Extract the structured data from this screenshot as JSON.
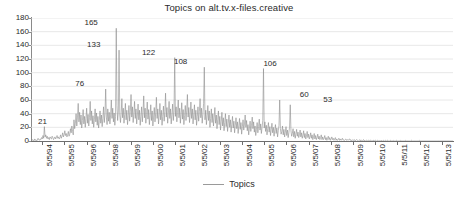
{
  "chart_data": {
    "type": "line",
    "title": "Topics on alt.tv.x-files.creative",
    "xlabel": "",
    "ylabel": "",
    "ylim": [
      0,
      180
    ],
    "ytick_step": 20,
    "yticks": [
      "0",
      "20",
      "40",
      "60",
      "80",
      "100",
      "120",
      "140",
      "160",
      "180"
    ],
    "xticks": [
      "5/5/94",
      "5/5/95",
      "5/5/96",
      "5/5/98",
      "5/5/99",
      "5/5/00",
      "5/5/01",
      "5/5/02",
      "5/5/03",
      "5/5/04",
      "5/5/05",
      "5/5/06",
      "5/5/07",
      "5/5/08",
      "5/5/09",
      "5/5/10",
      "5/5/11",
      "5/5/12",
      "5/5/13"
    ],
    "grid": true,
    "grid_axis": "y",
    "legend": [
      {
        "name": "Topics",
        "color": "#9a9a9a",
        "position": "bottom-center"
      }
    ],
    "series_color": "#8d8d8d",
    "annotations": [
      {
        "label": "21",
        "value": 21,
        "x_frac": 0.012
      },
      {
        "label": "76",
        "value": 76,
        "x_frac": 0.1
      },
      {
        "label": "133",
        "value": 133,
        "x_frac": 0.128
      },
      {
        "label": "165",
        "value": 165,
        "x_frac": 0.122
      },
      {
        "label": "122",
        "value": 122,
        "x_frac": 0.258
      },
      {
        "label": "108",
        "value": 108,
        "x_frac": 0.334
      },
      {
        "label": "106",
        "value": 106,
        "x_frac": 0.546
      },
      {
        "label": "60",
        "value": 60,
        "x_frac": 0.632
      },
      {
        "label": "53",
        "value": 53,
        "x_frac": 0.688
      }
    ],
    "series": [
      {
        "name": "Topics",
        "description": "Weekly topic counts on the Usenet newsgroup alt.tv.x-files.creative, 5/5/1994 through 5/5/2013. Dense high-frequency noise peaking 1996-2000, decaying to near zero after 2009.",
        "values": [
          1,
          0,
          2,
          1,
          0,
          3,
          1,
          2,
          0,
          1,
          4,
          2,
          1,
          3,
          2,
          5,
          3,
          8,
          4,
          21,
          6,
          9,
          4,
          7,
          3,
          5,
          2,
          6,
          4,
          3,
          7,
          5,
          2,
          4,
          6,
          3,
          5,
          8,
          4,
          6,
          3,
          5,
          9,
          4,
          7,
          12,
          6,
          9,
          15,
          8,
          11,
          6,
          9,
          14,
          7,
          10,
          18,
          12,
          22,
          14,
          9,
          31,
          18,
          26,
          40,
          22,
          35,
          55,
          28,
          42,
          24,
          38,
          19,
          30,
          46,
          25,
          36,
          20,
          33,
          48,
          26,
          39,
          22,
          34,
          58,
          30,
          44,
          25,
          37,
          20,
          32,
          47,
          28,
          41,
          23,
          36,
          19,
          30,
          44,
          26,
          38,
          21,
          33,
          50,
          27,
          40,
          76,
          35,
          24,
          47,
          29,
          42,
          25,
          38,
          60,
          33,
          48,
          28,
          41,
          23,
          36,
          165,
          52,
          30,
          44,
          133,
          38,
          27,
          41,
          62,
          34,
          48,
          26,
          39,
          55,
          31,
          45,
          24,
          37,
          52,
          29,
          43,
          68,
          35,
          50,
          27,
          40,
          58,
          33,
          47,
          25,
          38,
          54,
          31,
          45,
          23,
          36,
          50,
          28,
          42,
          66,
          34,
          48,
          26,
          39,
          57,
          32,
          46,
          24,
          37,
          53,
          30,
          44,
          22,
          35,
          49,
          28,
          41,
          64,
          33,
          47,
          25,
          38,
          55,
          31,
          45,
          23,
          36,
          51,
          29,
          43,
          70,
          35,
          49,
          26,
          40,
          58,
          33,
          47,
          25,
          38,
          54,
          30,
          44,
          122,
          36,
          50,
          28,
          42,
          60,
          34,
          48,
          26,
          39,
          56,
          32,
          46,
          24,
          37,
          52,
          30,
          44,
          68,
          35,
          49,
          27,
          40,
          57,
          33,
          47,
          25,
          38,
          53,
          31,
          45,
          23,
          36,
          50,
          29,
          43,
          62,
          34,
          48,
          26,
          39,
          55,
          108,
          31,
          45,
          24,
          37,
          52,
          30,
          44,
          20,
          33,
          47,
          27,
          40,
          22,
          35,
          49,
          26,
          38,
          18,
          31,
          44,
          24,
          36,
          16,
          29,
          42,
          22,
          34,
          15,
          27,
          40,
          21,
          32,
          14,
          26,
          38,
          20,
          31,
          13,
          24,
          36,
          19,
          29,
          12,
          23,
          34,
          18,
          28,
          11,
          22,
          33,
          17,
          27,
          10,
          21,
          31,
          16,
          25,
          38,
          20,
          30,
          15,
          24,
          9,
          19,
          29,
          14,
          23,
          35,
          18,
          28,
          13,
          22,
          8,
          17,
          27,
          12,
          21,
          32,
          16,
          25,
          11,
          20,
          30,
          106,
          19,
          28,
          14,
          23,
          9,
          18,
          27,
          13,
          21,
          8,
          17,
          26,
          12,
          20,
          7,
          16,
          24,
          11,
          19,
          6,
          15,
          23,
          60,
          18,
          10,
          14,
          22,
          9,
          17,
          6,
          13,
          21,
          8,
          16,
          5,
          12,
          20,
          53,
          15,
          7,
          11,
          18,
          6,
          14,
          4,
          10,
          17,
          7,
          13,
          5,
          9,
          16,
          6,
          12,
          4,
          8,
          15,
          5,
          11,
          3,
          7,
          14,
          5,
          10,
          3,
          6,
          12,
          4,
          9,
          2,
          6,
          11,
          3,
          8,
          2,
          5,
          10,
          3,
          7,
          2,
          5,
          9,
          2,
          6,
          2,
          4,
          8,
          2,
          5,
          1,
          4,
          7,
          2,
          5,
          1,
          3,
          6,
          2,
          4,
          1,
          3,
          5,
          1,
          3,
          1,
          2,
          4,
          1,
          3,
          1,
          2,
          4,
          1,
          2,
          1,
          2,
          3,
          1,
          2,
          1,
          2,
          3,
          1,
          2,
          0,
          1,
          2,
          1,
          2,
          0,
          1,
          2,
          1,
          1,
          0,
          1,
          2,
          0,
          1,
          0,
          1,
          2,
          0,
          1,
          0,
          1,
          1,
          0,
          1,
          0,
          1,
          1,
          0,
          1,
          0,
          1,
          1,
          0,
          1,
          0,
          0,
          1,
          0,
          1,
          0,
          0,
          1,
          0,
          0,
          1,
          0,
          0,
          1,
          0,
          0,
          1,
          0,
          0,
          0,
          1,
          0,
          0,
          0,
          1,
          0,
          0,
          0,
          0,
          1,
          0,
          0,
          0,
          0,
          0,
          1,
          0,
          0,
          0,
          0,
          0,
          0,
          1,
          0,
          0,
          0,
          0,
          0,
          0,
          0,
          1,
          0,
          0,
          0,
          0,
          0,
          0,
          0,
          0,
          0,
          0,
          1,
          0,
          0,
          0,
          0,
          0,
          0,
          0,
          0,
          0,
          0,
          0,
          0,
          0,
          0,
          0,
          0,
          0,
          0,
          0,
          0,
          0,
          0,
          0,
          0,
          0,
          0,
          0,
          0,
          0,
          0,
          0,
          0,
          0,
          0,
          0,
          0,
          0,
          0,
          0,
          0,
          0,
          0,
          0,
          0,
          0,
          0,
          0,
          0
        ]
      }
    ]
  }
}
